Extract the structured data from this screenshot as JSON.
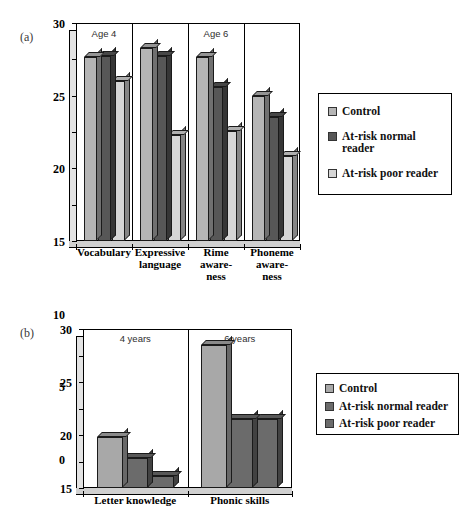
{
  "figure": {
    "panel_a_label": "(a)",
    "panel_b_label": "(b)"
  },
  "colors": {
    "control": "#b5b5b5",
    "at_risk_normal": "#575757",
    "at_risk_poor": "#d6d6d6",
    "control_b": "#a8a8a8",
    "at_risk_normal_b": "#6b6b6b",
    "at_risk_poor_b": "#6b6b6b",
    "axis": "#000000",
    "background": "#ffffff"
  },
  "panel_a": {
    "annotations": [
      {
        "text": "Age 4"
      },
      {
        "text": "Age 6"
      }
    ],
    "legend": {
      "items": [
        {
          "label": "Control",
          "color": "#b5b5b5"
        },
        {
          "label": "At-risk normal\nreader",
          "color": "#575757"
        },
        {
          "label": "At-risk poor reader",
          "color": "#d6d6d6"
        }
      ]
    },
    "chart_data": {
      "type": "bar",
      "title": "",
      "xlabel": "",
      "ylabel": "",
      "ylim": [
        0,
        30
      ],
      "yticks": [
        0,
        5,
        10,
        15,
        20,
        25,
        30
      ],
      "ytick_labels": [
        "0",
        "5",
        "10",
        "15",
        "20",
        "25",
        "30"
      ],
      "grid": false,
      "legend_position": "right",
      "categories": [
        "Vocabulary",
        "Expressive\nlanguage",
        "Rime\naware-\nness",
        "Phoneme\naware-\nness"
      ],
      "group_annotations": [
        "Age 4",
        "Age 4",
        "Age 6",
        "Age 6"
      ],
      "series": [
        {
          "name": "Control",
          "color": "#b5b5b5",
          "values": [
            25.3,
            26.6,
            25.3,
            19.9
          ]
        },
        {
          "name": "At-risk normal reader",
          "color": "#575757",
          "values": [
            25.4,
            25.4,
            21.2,
            17.0
          ]
        },
        {
          "name": "At-risk poor reader",
          "color": "#d6d6d6",
          "values": [
            22.0,
            14.6,
            15.2,
            11.7
          ]
        }
      ]
    }
  },
  "panel_b": {
    "annotations": [
      {
        "text": "4 years"
      },
      {
        "text": "6 years"
      }
    ],
    "legend": {
      "items": [
        {
          "label": "Control",
          "color": "#a8a8a8"
        },
        {
          "label": "At-risk normal reader",
          "color": "#6b6b6b"
        },
        {
          "label": "At-risk poor reader",
          "color": "#6b6b6b"
        }
      ]
    },
    "chart_data": {
      "type": "bar",
      "title": "",
      "xlabel": "",
      "ylabel": "",
      "ylim": [
        0,
        30
      ],
      "yticks": [
        0,
        5,
        10,
        15,
        20,
        25,
        30
      ],
      "ytick_labels": [
        "0",
        "5",
        "10",
        "15",
        "20",
        "25",
        "30"
      ],
      "grid": false,
      "legend_position": "right",
      "categories": [
        "Letter knowledge",
        "Phonic skills"
      ],
      "group_annotations": [
        "4 years",
        "6 years"
      ],
      "series": [
        {
          "name": "Control",
          "color": "#a8a8a8",
          "values": [
            9.6,
            27.0
          ]
        },
        {
          "name": "At-risk normal reader",
          "color": "#6b6b6b",
          "values": [
            5.6,
            13.1
          ]
        },
        {
          "name": "At-risk poor reader",
          "color": "#6b6b6b",
          "values": [
            2.2,
            13.0
          ]
        }
      ]
    }
  }
}
